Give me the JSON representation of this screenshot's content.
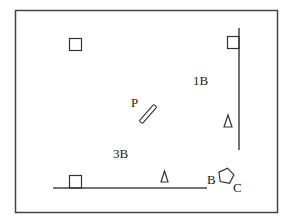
{
  "diagram": {
    "colors": {
      "background": "#ffffff",
      "stroke": "#333333",
      "frame": "#444444",
      "text": "#222222"
    },
    "labels": {
      "one_b": "1B",
      "three_b": "3B",
      "p": "P",
      "b": "B",
      "c": "C"
    },
    "shapes": {
      "frame": {
        "x": 15,
        "y": 10,
        "w": 262,
        "h": 202
      },
      "right_wall": {
        "x": 239,
        "y1": 28,
        "y2": 150
      },
      "bottom_wall": {
        "x1": 53,
        "x2": 207,
        "y": 188
      },
      "squares": [
        {
          "name": "top-left-square",
          "x": 69,
          "y": 38,
          "size": 12
        },
        {
          "name": "top-right-square",
          "x": 227,
          "y": 36,
          "size": 12
        },
        {
          "name": "bottom-left-square",
          "x": 69,
          "y": 176,
          "size": 12
        }
      ],
      "triangles": [
        {
          "name": "right-triangle",
          "points": "224,127 228,115 232,127"
        },
        {
          "name": "bottom-triangle",
          "points": "161,182 164.5,171 168,182"
        }
      ],
      "pentagon": {
        "cx": 226,
        "cy": 176,
        "r": 8
      },
      "bar": {
        "x1": 141,
        "y1": 122,
        "x2": 155,
        "y2": 106,
        "width": 4
      }
    }
  }
}
